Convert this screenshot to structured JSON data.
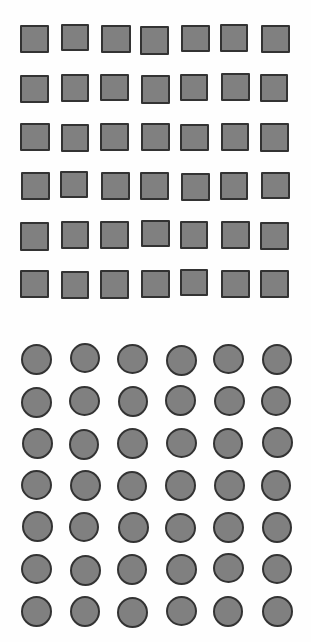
{
  "canvas": {
    "width": 311,
    "height": 642,
    "background_color": "#fefefe"
  },
  "sections": [
    {
      "id": "square-grid",
      "name": "square-grid",
      "shape_type": "square",
      "rows": 6,
      "columns": 7,
      "count": 42,
      "fill_color": "#808080",
      "border_color": "#333333",
      "border_width": 2,
      "shape_width": 29,
      "shape_height": 28,
      "origin_x": 20,
      "origin_y": 25,
      "pitch_x": 40,
      "pitch_y": 49
    },
    {
      "id": "circle-grid",
      "name": "circle-grid",
      "shape_type": "circle",
      "rows": 7,
      "columns": 6,
      "count": 42,
      "fill_color": "#808080",
      "border_color": "#333333",
      "border_width": 2,
      "shape_width": 31,
      "shape_height": 31,
      "origin_x": 21,
      "origin_y": 344,
      "pitch_x": 48,
      "pitch_y": 42
    }
  ],
  "jitter": {
    "square_offsets": [
      [
        0,
        0
      ],
      [
        1,
        -1
      ],
      [
        1,
        0
      ],
      [
        0,
        1
      ],
      [
        1,
        0
      ],
      [
        0,
        -1
      ],
      [
        1,
        0
      ],
      [
        0,
        1
      ],
      [
        1,
        0
      ],
      [
        0,
        0
      ],
      [
        1,
        1
      ],
      [
        0,
        0
      ],
      [
        1,
        -1
      ],
      [
        0,
        0
      ],
      [
        0,
        0
      ],
      [
        1,
        1
      ],
      [
        0,
        0
      ],
      [
        1,
        0
      ],
      [
        0,
        1
      ],
      [
        1,
        0
      ],
      [
        0,
        0
      ],
      [
        1,
        0
      ],
      [
        0,
        -1
      ],
      [
        1,
        0
      ],
      [
        0,
        0
      ],
      [
        1,
        1
      ],
      [
        0,
        0
      ],
      [
        1,
        0
      ],
      [
        0,
        1
      ],
      [
        1,
        0
      ],
      [
        0,
        0
      ],
      [
        1,
        -1
      ],
      [
        0,
        0
      ],
      [
        1,
        0
      ],
      [
        0,
        1
      ],
      [
        0,
        0
      ],
      [
        1,
        1
      ],
      [
        0,
        0
      ],
      [
        1,
        0
      ],
      [
        0,
        -1
      ],
      [
        1,
        0
      ],
      [
        0,
        0
      ]
    ],
    "square_sizes": [
      [
        29,
        28
      ],
      [
        28,
        27
      ],
      [
        30,
        28
      ],
      [
        29,
        29
      ],
      [
        29,
        27
      ],
      [
        28,
        28
      ],
      [
        29,
        28
      ],
      [
        29,
        28
      ],
      [
        28,
        28
      ],
      [
        29,
        27
      ],
      [
        29,
        29
      ],
      [
        28,
        27
      ],
      [
        29,
        28
      ],
      [
        28,
        28
      ],
      [
        30,
        28
      ],
      [
        28,
        28
      ],
      [
        29,
        28
      ],
      [
        29,
        28
      ],
      [
        29,
        27
      ],
      [
        28,
        28
      ],
      [
        29,
        29
      ],
      [
        29,
        28
      ],
      [
        28,
        27
      ],
      [
        29,
        28
      ],
      [
        29,
        28
      ],
      [
        29,
        28
      ],
      [
        28,
        28
      ],
      [
        29,
        27
      ],
      [
        29,
        29
      ],
      [
        28,
        28
      ],
      [
        29,
        28
      ],
      [
        29,
        27
      ],
      [
        28,
        28
      ],
      [
        29,
        28
      ],
      [
        29,
        28
      ],
      [
        29,
        28
      ],
      [
        28,
        28
      ],
      [
        29,
        29
      ],
      [
        29,
        28
      ],
      [
        28,
        27
      ],
      [
        29,
        28
      ],
      [
        29,
        28
      ]
    ],
    "circle_offsets": [
      [
        0,
        0
      ],
      [
        1,
        -1
      ],
      [
        0,
        0
      ],
      [
        1,
        1
      ],
      [
        0,
        0
      ],
      [
        1,
        0
      ],
      [
        0,
        1
      ],
      [
        0,
        0
      ],
      [
        1,
        0
      ],
      [
        0,
        -1
      ],
      [
        1,
        0
      ],
      [
        0,
        0
      ],
      [
        1,
        0
      ],
      [
        0,
        1
      ],
      [
        0,
        0
      ],
      [
        1,
        0
      ],
      [
        0,
        0
      ],
      [
        1,
        -1
      ],
      [
        0,
        0
      ],
      [
        1,
        0
      ],
      [
        0,
        1
      ],
      [
        0,
        0
      ],
      [
        1,
        0
      ],
      [
        0,
        0
      ],
      [
        1,
        -1
      ],
      [
        0,
        0
      ],
      [
        1,
        0
      ],
      [
        0,
        1
      ],
      [
        0,
        0
      ],
      [
        1,
        0
      ],
      [
        0,
        0
      ],
      [
        1,
        1
      ],
      [
        0,
        0
      ],
      [
        1,
        0
      ],
      [
        0,
        -1
      ],
      [
        1,
        0
      ],
      [
        0,
        0
      ],
      [
        1,
        0
      ],
      [
        0,
        1
      ],
      [
        1,
        0
      ],
      [
        0,
        0
      ],
      [
        1,
        0
      ]
    ],
    "circle_sizes": [
      [
        31,
        31
      ],
      [
        30,
        30
      ],
      [
        31,
        30
      ],
      [
        31,
        31
      ],
      [
        31,
        30
      ],
      [
        30,
        31
      ],
      [
        31,
        31
      ],
      [
        31,
        30
      ],
      [
        30,
        31
      ],
      [
        31,
        31
      ],
      [
        31,
        30
      ],
      [
        30,
        30
      ],
      [
        31,
        31
      ],
      [
        30,
        31
      ],
      [
        31,
        31
      ],
      [
        31,
        30
      ],
      [
        30,
        31
      ],
      [
        31,
        31
      ],
      [
        31,
        30
      ],
      [
        31,
        31
      ],
      [
        30,
        30
      ],
      [
        31,
        31
      ],
      [
        31,
        31
      ],
      [
        30,
        31
      ],
      [
        31,
        31
      ],
      [
        30,
        30
      ],
      [
        31,
        31
      ],
      [
        31,
        30
      ],
      [
        31,
        31
      ],
      [
        30,
        31
      ],
      [
        31,
        30
      ],
      [
        31,
        31
      ],
      [
        30,
        31
      ],
      [
        31,
        31
      ],
      [
        31,
        30
      ],
      [
        30,
        30
      ],
      [
        31,
        31
      ],
      [
        30,
        31
      ],
      [
        31,
        31
      ],
      [
        31,
        30
      ],
      [
        30,
        31
      ],
      [
        31,
        31
      ]
    ]
  },
  "chart_data": {
    "type": "scatter",
    "title": "",
    "xlabel": "",
    "ylabel": "",
    "series": [
      {
        "name": "squares",
        "marker": "square",
        "color": "#808080",
        "edge_color": "#333333",
        "count": 42,
        "rows": 6,
        "columns": 7
      },
      {
        "name": "circles",
        "marker": "circle",
        "color": "#808080",
        "edge_color": "#333333",
        "count": 42,
        "rows": 7,
        "columns": 6
      }
    ],
    "grid": false,
    "legend": "none",
    "xlim": [
      0,
      311
    ],
    "ylim": [
      0,
      642
    ]
  }
}
